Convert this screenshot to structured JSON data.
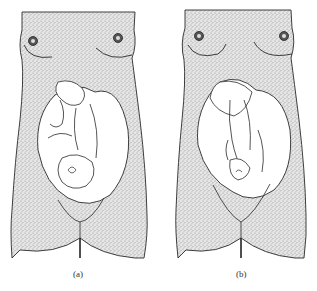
{
  "figure": {
    "panels": [
      {
        "id": "a",
        "caption": "(a)",
        "subject": "twins-in-uterus-variant-a"
      },
      {
        "id": "b",
        "caption": "(b)",
        "subject": "twins-in-uterus-variant-b"
      }
    ],
    "colors": {
      "stipple": "#9a9a9a",
      "outline": "#2a2a2a",
      "background": "#ffffff"
    }
  }
}
